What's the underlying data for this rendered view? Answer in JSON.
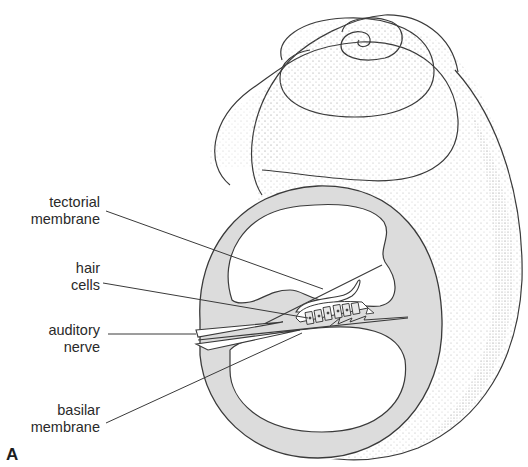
{
  "figure": {
    "panel_label": "A",
    "colors": {
      "outline": "#3a3a3a",
      "duct_fill": "#dcdcdc",
      "stipple": "#b8b8b8",
      "background": "#ffffff"
    }
  },
  "labels": [
    {
      "id": "tectorial-membrane",
      "line1": "tectorial",
      "line2": "membrane"
    },
    {
      "id": "hair-cells",
      "line1": "hair",
      "line2": "cells"
    },
    {
      "id": "auditory-nerve",
      "line1": "auditory",
      "line2": "nerve"
    },
    {
      "id": "basilar-membrane",
      "line1": "basilar",
      "line2": "membrane"
    }
  ]
}
